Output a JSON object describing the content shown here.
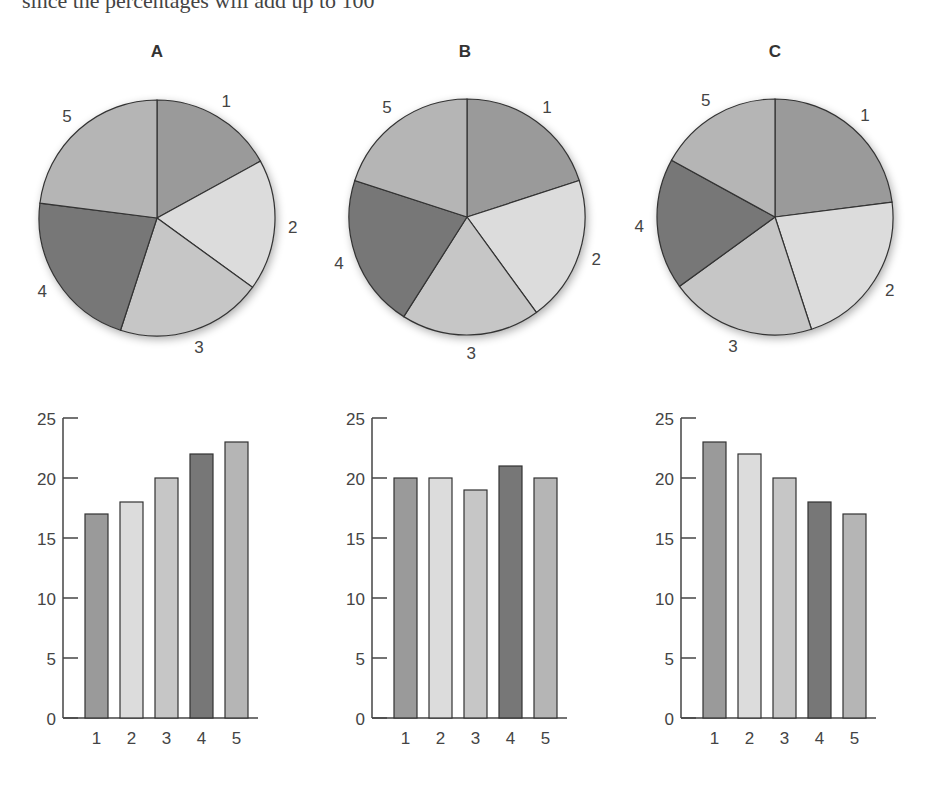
{
  "header_text": "since the percentages will add up to 100",
  "colors": {
    "1": "#9a9a9a",
    "2": "#dcdcdc",
    "3": "#c6c6c6",
    "4": "#777777",
    "5": "#b5b5b5",
    "stroke": "#333333"
  },
  "chart_data": [
    {
      "type": "pie",
      "title": "A",
      "categories": [
        "1",
        "2",
        "3",
        "4",
        "5"
      ],
      "values": [
        17,
        18,
        20,
        22,
        23
      ]
    },
    {
      "type": "pie",
      "title": "B",
      "categories": [
        "1",
        "2",
        "3",
        "4",
        "5"
      ],
      "values": [
        20,
        20,
        19,
        21,
        20
      ]
    },
    {
      "type": "pie",
      "title": "C",
      "categories": [
        "1",
        "2",
        "3",
        "4",
        "5"
      ],
      "values": [
        23,
        22,
        20,
        18,
        17
      ]
    },
    {
      "type": "bar",
      "title": "",
      "categories": [
        "1",
        "2",
        "3",
        "4",
        "5"
      ],
      "values": [
        17,
        18,
        20,
        22,
        23
      ],
      "ylim": [
        0,
        25
      ],
      "yticks": [
        0,
        5,
        10,
        15,
        20,
        25
      ]
    },
    {
      "type": "bar",
      "title": "",
      "categories": [
        "1",
        "2",
        "3",
        "4",
        "5"
      ],
      "values": [
        20,
        20,
        19,
        21,
        20
      ],
      "ylim": [
        0,
        25
      ],
      "yticks": [
        0,
        5,
        10,
        15,
        20,
        25
      ]
    },
    {
      "type": "bar",
      "title": "",
      "categories": [
        "1",
        "2",
        "3",
        "4",
        "5"
      ],
      "values": [
        23,
        22,
        20,
        18,
        17
      ],
      "ylim": [
        0,
        25
      ],
      "yticks": [
        0,
        5,
        10,
        15,
        20,
        25
      ]
    }
  ]
}
